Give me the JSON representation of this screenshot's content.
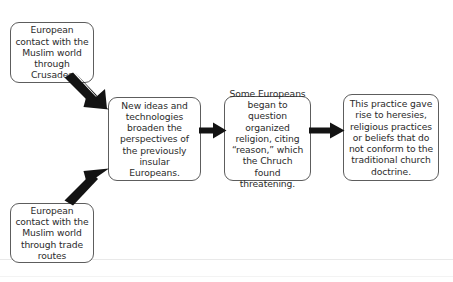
{
  "diagram": {
    "type": "flowchart",
    "background_color": "#ffffff",
    "box_border_color": "#5d5d5d",
    "text_color": "#2b2b2b",
    "arrow_color": "#131313",
    "nodes": [
      {
        "id": "crusades",
        "text": "European contact with the Muslim world through Crusades"
      },
      {
        "id": "trade",
        "text": "European contact with the Muslim world through trade routes"
      },
      {
        "id": "newideas",
        "text": "New ideas and technologies broaden the perspectives of the previously insular Europeans."
      },
      {
        "id": "question",
        "text": "Some Europeans began to question organized religion, citing “reason,” which the Chruch found threatening."
      },
      {
        "id": "heresies",
        "text": "This practice gave rise to heresies, religious practices or beliefs that do not conform to the traditional church doctrine."
      }
    ],
    "edges": [
      {
        "id": "crusades-newideas",
        "from": "crusades",
        "to": "newideas",
        "direction": "down-right"
      },
      {
        "id": "trade-newideas",
        "from": "trade",
        "to": "newideas",
        "direction": "up-right"
      },
      {
        "id": "newideas-question",
        "from": "newideas",
        "to": "question",
        "direction": "right"
      },
      {
        "id": "question-heresies",
        "from": "question",
        "to": "heresies",
        "direction": "right"
      }
    ]
  }
}
